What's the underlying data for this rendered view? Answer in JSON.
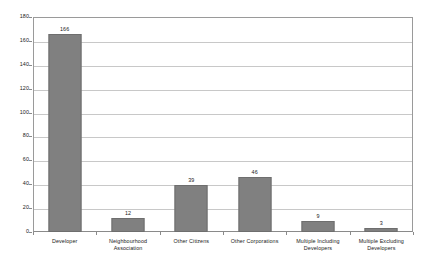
{
  "chart_data": {
    "type": "bar",
    "title": "",
    "subtitle": "",
    "xlabel": "",
    "ylabel": "",
    "categories": [
      "Developer",
      "Neighbourhood Association",
      "Other Citizens",
      "Other Corporations",
      "Multiple Including Developers",
      "Multiple Excluding Developers"
    ],
    "values": [
      166,
      12,
      39,
      46,
      9,
      3
    ],
    "data_labels": [
      "166",
      "12",
      "39",
      "46",
      "9",
      "3"
    ],
    "ylim": [
      0,
      180
    ],
    "ytick_step": 20,
    "ytick_labels": [
      "0",
      "20",
      "40",
      "60",
      "80",
      "100",
      "120",
      "140",
      "160",
      "180"
    ],
    "grid": true,
    "grid_axis": "y",
    "legend": false,
    "legend_position": "none",
    "bar_color": "#808080",
    "bar_edge_color": "#6e6e6e",
    "gridline_color": "#c8c8c8",
    "axis_color": "#8a8a8a",
    "background_color": "#ffffff",
    "text_color": "#1a1a1a"
  }
}
